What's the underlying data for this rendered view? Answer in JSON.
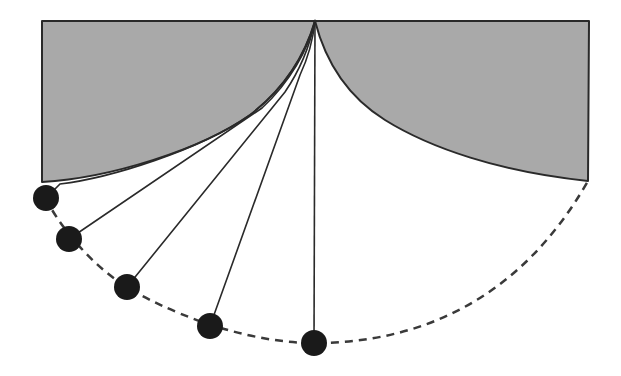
{
  "diagram": {
    "type": "cycloidal-pendulum",
    "width": 621,
    "height": 376,
    "colors": {
      "background": "#ffffff",
      "cheek_fill": "#a9a9a9",
      "stroke": "#2a2a2a",
      "bob": "#1a1a1a",
      "path": "#3a3a3a"
    },
    "pivot": {
      "x": 315,
      "y": 21
    },
    "frame": {
      "x1": 42,
      "y1": 21,
      "x2": 589,
      "y2": 21
    },
    "left_cheek": {
      "top_left": {
        "x": 42,
        "y": 21
      },
      "bottom_left": {
        "x": 42,
        "y": 182
      },
      "curve_path": "M 42 182 C 110 178, 200 150, 250 115 C 285 88, 305 55, 315 21"
    },
    "right_cheek": {
      "top_right": {
        "x": 589,
        "y": 21
      },
      "bottom_right": {
        "x": 588,
        "y": 181
      },
      "curve_path": "M 315 21 C 325 60, 345 95, 385 120 C 430 148, 500 172, 588 181"
    },
    "strings": [
      {
        "path": "M 315 21 C 305 55, 285 88, 250 115 C 200 150, 110 178, 60 184 L 46 198"
      },
      {
        "path": "M 315 21 C 308 50, 290 82, 262 108 L 69 239"
      },
      {
        "path": "M 315 21 C 310 45, 300 70, 285 92 L 127 287"
      },
      {
        "path": "M 315 21 C 313 40, 308 58, 300 75 L 210 326"
      },
      {
        "path": "M 315 21 L 314 343"
      }
    ],
    "bobs": [
      {
        "label": "bob-1",
        "x": 46,
        "y": 198,
        "r": 13
      },
      {
        "label": "bob-2",
        "x": 69,
        "y": 239,
        "r": 13
      },
      {
        "label": "bob-3",
        "x": 127,
        "y": 287,
        "r": 13
      },
      {
        "label": "bob-4",
        "x": 210,
        "y": 326,
        "r": 13
      },
      {
        "label": "bob-5",
        "x": 314,
        "y": 343,
        "r": 13
      }
    ],
    "trajectory": {
      "style": "dashed",
      "dasharray": "8 6",
      "path": "M 46 198 C 55 220, 90 265, 127 287 C 160 308, 240 343, 314 343 C 420 343, 520 300, 588 181"
    }
  }
}
